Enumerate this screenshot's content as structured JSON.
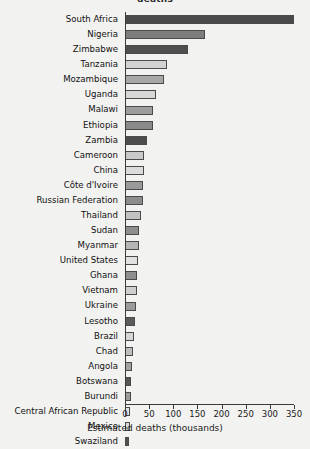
{
  "chart_data": {
    "type": "bar",
    "orientation": "horizontal",
    "title": "deaths",
    "xlabel": "Estimated deaths (thousands)",
    "ylabel": "",
    "xlim": [
      0,
      350
    ],
    "xticks": [
      0,
      50,
      100,
      150,
      200,
      250,
      300,
      350
    ],
    "grid": false,
    "legend": "none",
    "categories": [
      "South Africa",
      "Nigeria",
      "Zimbabwe",
      "Tanzania",
      "Mozambique",
      "Uganda",
      "Malawi",
      "Ethiopia",
      "Zambia",
      "Cameroon",
      "China",
      "Côte d'Ivoire",
      "Russian Federation",
      "Thailand",
      "Sudan",
      "Myanmar",
      "United States",
      "Ghana",
      "Vietnam",
      "Ukraine",
      "Lesotho",
      "Brazil",
      "Chad",
      "Angola",
      "Botswana",
      "Burundi",
      "Central African Republic",
      "Mexico",
      "Swaziland"
    ],
    "values": [
      350,
      165,
      130,
      86,
      81,
      64,
      58,
      57,
      46,
      39,
      39,
      38,
      37,
      33,
      29,
      28,
      26,
      25,
      24,
      23,
      21,
      18,
      17,
      14,
      13,
      12,
      11,
      10,
      9
    ],
    "bar_colors": [
      "#4a4a4a",
      "#7d7d7d",
      "#4f4f4f",
      "#d2d2d2",
      "#a8a8a8",
      "#d8d8d8",
      "#9d9d9d",
      "#8a8a8a",
      "#4d4d4d",
      "#c9c9c9",
      "#dcdcdc",
      "#9a9a9a",
      "#8c8c8c",
      "#c2c2c2",
      "#8e8e8e",
      "#b6b6b6",
      "#e0e0e0",
      "#8f8f8f",
      "#cfcfcf",
      "#9b9b9b",
      "#5a5a5a",
      "#d6d6d6",
      "#bdbdbd",
      "#a2a2a2",
      "#555555",
      "#9c9c9c",
      "#e2e2e2",
      "#d9d9d9",
      "#505050"
    ]
  },
  "axis": {
    "tick_labels": [
      "0",
      "50",
      "100",
      "150",
      "200",
      "250",
      "300",
      "350"
    ]
  }
}
